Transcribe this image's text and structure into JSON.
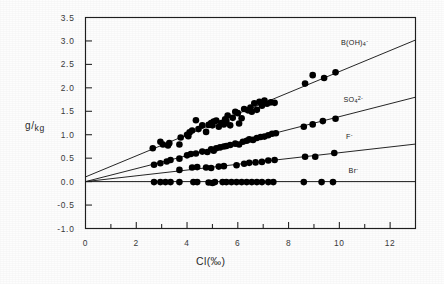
{
  "chart_data": {
    "type": "scatter",
    "title": "",
    "subtitle": "",
    "xlabel": "Cl(‰)",
    "ylabel": "g/kg",
    "ylabel_numerator": "g",
    "ylabel_denominator": "kg",
    "xlim": [
      0,
      13
    ],
    "ylim": [
      -1.0,
      3.5
    ],
    "xticks": [
      0,
      2,
      4,
      6,
      8,
      10,
      12
    ],
    "xtick_labels": [
      "0",
      "2",
      "4",
      "6",
      "8",
      "10",
      "12"
    ],
    "xminor_step": 1,
    "yticks": [
      -1.0,
      -0.5,
      0.0,
      0.5,
      1.0,
      1.5,
      2.0,
      2.5,
      3.0,
      3.5
    ],
    "ytick_labels": [
      "-1.0",
      "-0.5",
      "0.0",
      "0.5",
      "1.0",
      "1.5",
      "2.0",
      "2.5",
      "3.0",
      "3.5"
    ],
    "grid": false,
    "legend_position": "right-inline",
    "frame": "box",
    "marker": "filled-circle",
    "marker_color": "#000000",
    "line_color": "#1a1a1a",
    "series": [
      {
        "name": "B(OH)4-",
        "label_html": "B(OH)<sub>4</sub><sup>-</sup>",
        "label_x": 10.3,
        "label_y": 2.93,
        "fit_intercept": 0.1,
        "fit_slope": 0.2246,
        "fit_x_start": 0.0,
        "fit_x_end": 13.0,
        "points": [
          [
            2.65,
            0.71
          ],
          [
            2.95,
            0.85
          ],
          [
            3.05,
            0.79
          ],
          [
            3.25,
            0.77
          ],
          [
            3.3,
            0.82
          ],
          [
            3.7,
            0.79
          ],
          [
            3.75,
            0.94
          ],
          [
            4.0,
            1.0
          ],
          [
            4.05,
            0.97
          ],
          [
            4.1,
            1.05
          ],
          [
            4.2,
            1.09
          ],
          [
            4.35,
            1.31
          ],
          [
            4.45,
            1.12
          ],
          [
            4.6,
            1.2
          ],
          [
            4.75,
            1.06
          ],
          [
            4.85,
            1.21
          ],
          [
            4.95,
            1.25
          ],
          [
            5.0,
            1.2
          ],
          [
            5.05,
            1.28
          ],
          [
            5.15,
            1.3
          ],
          [
            5.25,
            1.17
          ],
          [
            5.35,
            1.25
          ],
          [
            5.45,
            1.22
          ],
          [
            5.5,
            1.33
          ],
          [
            5.55,
            1.29
          ],
          [
            5.6,
            1.41
          ],
          [
            5.7,
            1.2
          ],
          [
            5.8,
            1.36
          ],
          [
            5.9,
            1.49
          ],
          [
            6.0,
            1.46
          ],
          [
            6.05,
            1.24
          ],
          [
            6.15,
            1.35
          ],
          [
            6.25,
            1.55
          ],
          [
            6.4,
            1.52
          ],
          [
            6.5,
            1.58
          ],
          [
            6.55,
            1.49
          ],
          [
            6.65,
            1.67
          ],
          [
            6.75,
            1.53
          ],
          [
            6.85,
            1.7
          ],
          [
            6.95,
            1.62
          ],
          [
            7.05,
            1.73
          ],
          [
            7.15,
            1.66
          ],
          [
            7.3,
            1.69
          ],
          [
            7.45,
            1.68
          ],
          [
            8.65,
            2.09
          ],
          [
            8.95,
            2.27
          ],
          [
            9.4,
            2.21
          ],
          [
            9.85,
            2.33
          ]
        ]
      },
      {
        "name": "SO4 2-",
        "label_html": "SO<sub>4</sub><sup>2-</sup>",
        "label_x": 10.4,
        "label_y": 1.71,
        "fit_intercept": 0.0,
        "fit_slope": 0.1385,
        "fit_x_start": 0.0,
        "fit_x_end": 13.0,
        "points": [
          [
            2.7,
            0.36
          ],
          [
            2.95,
            0.39
          ],
          [
            3.2,
            0.43
          ],
          [
            3.35,
            0.46
          ],
          [
            3.7,
            0.49
          ],
          [
            4.0,
            0.56
          ],
          [
            4.15,
            0.59
          ],
          [
            4.35,
            0.6
          ],
          [
            4.6,
            0.64
          ],
          [
            4.8,
            0.63
          ],
          [
            4.95,
            0.69
          ],
          [
            5.05,
            0.66
          ],
          [
            5.15,
            0.71
          ],
          [
            5.3,
            0.73
          ],
          [
            5.45,
            0.75
          ],
          [
            5.55,
            0.76
          ],
          [
            5.7,
            0.78
          ],
          [
            5.9,
            0.81
          ],
          [
            6.05,
            0.79
          ],
          [
            6.2,
            0.85
          ],
          [
            6.35,
            0.87
          ],
          [
            6.45,
            0.9
          ],
          [
            6.6,
            0.89
          ],
          [
            6.75,
            0.93
          ],
          [
            6.9,
            0.95
          ],
          [
            7.05,
            0.96
          ],
          [
            7.2,
            0.99
          ],
          [
            7.35,
            1.02
          ],
          [
            7.5,
            1.03
          ],
          [
            8.6,
            1.17
          ],
          [
            8.95,
            1.22
          ],
          [
            9.35,
            1.29
          ],
          [
            9.85,
            1.34
          ]
        ]
      },
      {
        "name": "F-",
        "label_html": "F<sup>-</sup>",
        "label_x": 10.5,
        "label_y": 0.92,
        "fit_intercept": 0.0,
        "fit_slope": 0.0616,
        "fit_x_start": 0.0,
        "fit_x_end": 13.0,
        "points": [
          [
            3.7,
            0.25
          ],
          [
            4.2,
            0.3
          ],
          [
            4.4,
            0.31
          ],
          [
            4.75,
            0.3
          ],
          [
            4.95,
            0.29
          ],
          [
            5.25,
            0.32
          ],
          [
            5.45,
            0.33
          ],
          [
            5.95,
            0.35
          ],
          [
            6.25,
            0.38
          ],
          [
            6.45,
            0.4
          ],
          [
            6.7,
            0.41
          ],
          [
            6.95,
            0.42
          ],
          [
            7.2,
            0.45
          ],
          [
            7.45,
            0.46
          ],
          [
            8.65,
            0.53
          ],
          [
            9.05,
            0.53
          ],
          [
            9.8,
            0.61
          ]
        ]
      },
      {
        "name": "Br-",
        "label_html": "Br<sup>-</sup>",
        "label_x": 10.6,
        "label_y": 0.2,
        "fit_intercept": 0.0,
        "fit_slope": 0.0,
        "fit_x_start": 0.0,
        "fit_x_end": 13.0,
        "points": [
          [
            2.7,
            -0.01
          ],
          [
            2.95,
            -0.01
          ],
          [
            3.15,
            -0.01
          ],
          [
            3.35,
            -0.01
          ],
          [
            3.7,
            -0.01
          ],
          [
            4.25,
            -0.01
          ],
          [
            4.4,
            -0.01
          ],
          [
            4.85,
            -0.02
          ],
          [
            5.0,
            -0.03
          ],
          [
            5.1,
            -0.01
          ],
          [
            5.4,
            -0.01
          ],
          [
            5.55,
            -0.01
          ],
          [
            5.75,
            -0.01
          ],
          [
            5.95,
            -0.01
          ],
          [
            6.15,
            -0.01
          ],
          [
            6.35,
            -0.01
          ],
          [
            6.55,
            -0.01
          ],
          [
            6.75,
            -0.01
          ],
          [
            6.95,
            -0.01
          ],
          [
            7.2,
            -0.01
          ],
          [
            7.4,
            -0.01
          ],
          [
            8.6,
            -0.01
          ],
          [
            9.3,
            -0.01
          ],
          [
            9.75,
            -0.01
          ]
        ]
      }
    ]
  }
}
